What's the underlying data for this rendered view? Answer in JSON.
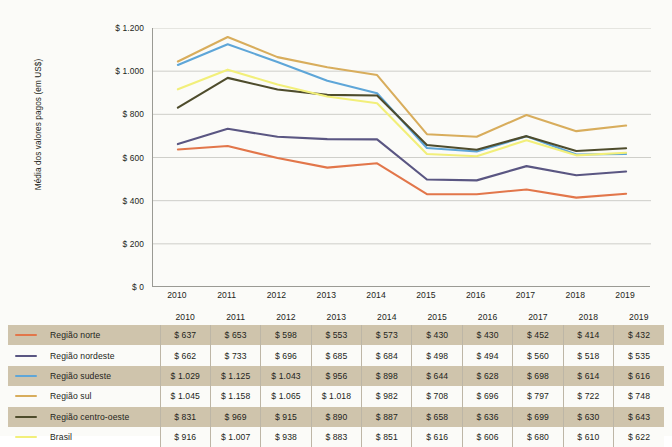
{
  "chart_data": {
    "type": "line",
    "title": "",
    "xlabel": "",
    "ylabel": "Média dos valores pagos (em US$)",
    "ylim": [
      0,
      1200
    ],
    "ytick_values": [
      1200,
      1000,
      800,
      600,
      400,
      200,
      0
    ],
    "ytick_labels": [
      "$ 1.200",
      "$ 1.000",
      "$ 800",
      "$ 600",
      "$ 400",
      "$ 200",
      "$ 0"
    ],
    "grid": true,
    "legend_position": "table-left",
    "categories": [
      "2010",
      "2011",
      "2012",
      "2013",
      "2014",
      "2015",
      "2016",
      "2017",
      "2018",
      "2019"
    ],
    "series": [
      {
        "name": "Região norte",
        "color": "#e2764a",
        "values": [
          637,
          653,
          598,
          553,
          573,
          430,
          430,
          452,
          414,
          432
        ],
        "labels": [
          "$ 637",
          "$ 653",
          "$ 598",
          "$ 553",
          "$ 573",
          "$ 430",
          "$ 430",
          "$ 452",
          "$ 414",
          "$ 432"
        ]
      },
      {
        "name": "Região nordeste",
        "color": "#5a5682",
        "values": [
          662,
          733,
          696,
          685,
          684,
          498,
          494,
          560,
          518,
          535
        ],
        "labels": [
          "$ 662",
          "$ 733",
          "$ 696",
          "$ 685",
          "$ 684",
          "$ 498",
          "$ 494",
          "$ 560",
          "$ 518",
          "$ 535"
        ]
      },
      {
        "name": "Região sudeste",
        "color": "#5ea6d8",
        "values": [
          1029,
          1125,
          1043,
          956,
          898,
          644,
          628,
          698,
          614,
          616
        ],
        "labels": [
          "$ 1.029",
          "$ 1.125",
          "$ 1.043",
          "$ 956",
          "$ 898",
          "$ 644",
          "$ 628",
          "$ 698",
          "$ 614",
          "$ 616"
        ]
      },
      {
        "name": "Região sul",
        "color": "#d8ad5c",
        "values": [
          1045,
          1158,
          1065,
          1018,
          982,
          708,
          696,
          797,
          722,
          748
        ],
        "labels": [
          "$ 1.045",
          "$ 1.158",
          "$ 1.065",
          "$ 1.018",
          "$ 982",
          "$ 708",
          "$ 696",
          "$ 797",
          "$ 722",
          "$ 748"
        ]
      },
      {
        "name": "Região centro-oeste",
        "color": "#4e4c2c",
        "values": [
          831,
          969,
          915,
          890,
          887,
          658,
          636,
          699,
          630,
          643
        ],
        "labels": [
          "$ 831",
          "$ 969",
          "$ 915",
          "$ 890",
          "$ 887",
          "$ 658",
          "$ 636",
          "$ 699",
          "$ 630",
          "$ 643"
        ]
      },
      {
        "name": "Brasil",
        "color": "#f2ef7a",
        "values": [
          916,
          1007,
          938,
          883,
          851,
          616,
          606,
          680,
          610,
          622
        ],
        "labels": [
          "$ 916",
          "$ 1.007",
          "$ 938",
          "$ 883",
          "$ 851",
          "$ 616",
          "$ 606",
          "$ 680",
          "$ 610",
          "$ 622"
        ]
      }
    ]
  },
  "table": {
    "corner_label": "",
    "header": [
      "2010",
      "2011",
      "2012",
      "2013",
      "2014",
      "2015",
      "2016",
      "2017",
      "2018",
      "2019"
    ]
  },
  "colors": {
    "background": "#fbfbf8",
    "grid": "#c9c9c4",
    "axis": "#9a9a94",
    "row_shade": "#cfc4ac",
    "cell_divider": "#bdb6a6",
    "text": "#231f20"
  }
}
